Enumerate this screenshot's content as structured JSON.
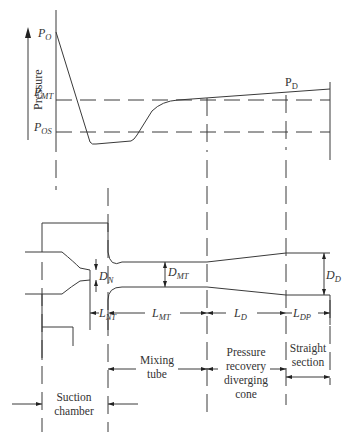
{
  "diagram": {
    "type": "jet pump pressure distribution and geometry",
    "pressure_axis": {
      "label": "Pressure",
      "levels": [
        {
          "symbol": "P",
          "subscript": "O"
        },
        {
          "symbol": "P",
          "subscript": "MT"
        },
        {
          "symbol": "P",
          "subscript": "OS"
        },
        {
          "symbol": "P",
          "subscript": "D"
        }
      ]
    },
    "labels": {
      "p_o": {
        "main": "P",
        "sub": "O"
      },
      "p_mt": {
        "main": "P",
        "sub": "MT"
      },
      "p_os": {
        "main": "P",
        "sub": "OS"
      },
      "p_d": {
        "main": "P",
        "sub": "D"
      },
      "pressure": "Pressure"
    },
    "dimensions": {
      "d_n": {
        "main": "D",
        "sub": "N"
      },
      "d_mt": {
        "main": "D",
        "sub": "MT"
      },
      "d_d": {
        "main": "D",
        "sub": "D"
      },
      "l_nt": {
        "main": "L",
        "sub": "NT"
      },
      "l_mt": {
        "main": "L",
        "sub": "MT"
      },
      "l_d": {
        "main": "L",
        "sub": "D"
      },
      "l_dp": {
        "main": "L",
        "sub": "DP"
      }
    },
    "sections": {
      "mixing_tube": [
        "Mixing",
        "tube"
      ],
      "diverging_cone": [
        "Pressure",
        "recovery",
        "diverging",
        "cone"
      ],
      "straight_section": [
        "Straight",
        "section"
      ],
      "suction_chamber": [
        "Suction",
        "chamber"
      ]
    }
  }
}
